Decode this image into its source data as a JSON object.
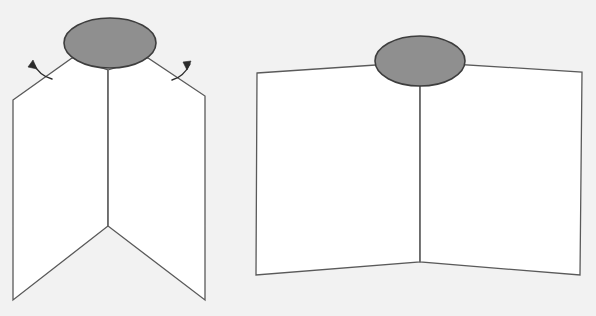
{
  "canvas": {
    "width": 596,
    "height": 316,
    "background_color": "#f2f2f2",
    "title": "",
    "caption": ""
  },
  "style": {
    "panel_fill": "#ffffff",
    "panel_stroke": "#5a5a5a",
    "panel_stroke_width": 1.3,
    "ellipse_fill": "#8f8f8f",
    "ellipse_stroke": "#3d3d3d",
    "ellipse_stroke_width": 1.6,
    "arrow_color": "#2b2b2b",
    "arrow_stroke_width": 1.4,
    "fold_line_color": "#6a6a6a",
    "fold_line_width": 1.2
  },
  "figures": [
    {
      "id": "left-figure",
      "name": "folded-panel-with-arrows",
      "label": "",
      "ellipse": {
        "name": "gray-ellipse-top",
        "cx": 110,
        "cy": 43,
        "rx": 46,
        "ry": 25,
        "fill": "#8f8f8f"
      },
      "left_panel": {
        "name": "left-panel",
        "points": "13,100 72,58 108,70 108,226"
      },
      "right_panel": {
        "name": "right-panel",
        "points": "108,70 148,58 205,96 205,300"
      },
      "left_panel_full": {
        "name": "left-panel-outline",
        "points": "13,100 72,58 108,70 108,226 13,300"
      },
      "right_panel_full": {
        "name": "right-panel-outline",
        "points": "108,70 148,58 205,96 205,300 108,226"
      },
      "fold_line": {
        "name": "center-fold-line",
        "x1": 108,
        "y1": 70,
        "x2": 108,
        "y2": 226
      },
      "arrows": [
        {
          "name": "unfold-arrow-left",
          "direction": "up-left",
          "path": "M 52,79 C 44,77 37,71 33,63",
          "head": "33,60 37,69 28,67"
        },
        {
          "name": "unfold-arrow-right",
          "direction": "up-right",
          "path": "M 172,80 C 180,78 186,72 190,64",
          "head": "191,61 187,70 183,62"
        }
      ]
    },
    {
      "id": "right-figure",
      "name": "unfolded-panel",
      "label": "",
      "ellipse": {
        "name": "gray-ellipse-top",
        "cx": 420,
        "cy": 61,
        "rx": 45,
        "ry": 25,
        "fill": "#8f8f8f"
      },
      "left_panel_full": {
        "name": "left-panel-outline",
        "points": "257,73 420,62 420,262 256,275"
      },
      "right_panel_full": {
        "name": "right-panel-outline",
        "points": "420,62 582,72 580,275 420,262"
      },
      "fold_line": {
        "name": "center-fold-line",
        "x1": 420,
        "y1": 62,
        "x2": 420,
        "y2": 262
      },
      "arrows": []
    }
  ],
  "annotations": {
    "left_caption": "",
    "right_caption": ""
  }
}
